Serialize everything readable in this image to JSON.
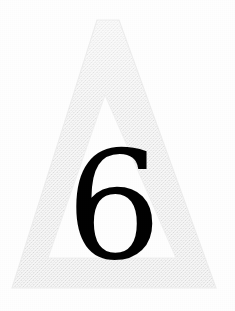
{
  "page": {
    "kind": "scanned-page-figure",
    "width": 235,
    "height": 311,
    "background_color": "#ffffff"
  },
  "figure": {
    "name": "chapter-number-triangle",
    "shape_label": "triangle-outline",
    "shape_icon": "triangle-outline-icon",
    "fill_color": "#e9e9e9",
    "fill_color_light": "#f1f1f1",
    "edge_color": "#dedede",
    "texture": "halftone-dither",
    "outer": {
      "apex_left_x": 97,
      "apex_right_x": 119,
      "apex_y": 20,
      "bottom_left_x": 12,
      "bottom_right_x": 216,
      "bottom_y": 288
    },
    "inner": {
      "apex_x": 105,
      "apex_y": 95,
      "bottom_left_x": 48,
      "bottom_right_x": 176,
      "bottom_y": 258
    }
  },
  "numeral": {
    "value": "6",
    "color": "#020202",
    "center_x": 114,
    "baseline_y": 258,
    "font_size_px": 150,
    "label": "chapter-number"
  }
}
